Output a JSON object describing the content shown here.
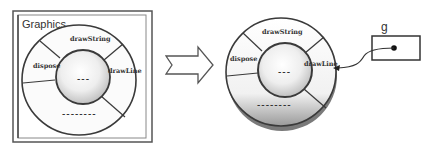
{
  "left_panel": {
    "title": "Graphics",
    "segments": {
      "top": "drawString",
      "left": "dispose",
      "right": "drawLine",
      "bottom": "--------"
    },
    "core_label": "---"
  },
  "transition_arrow": {
    "icon": "hollow-right-arrow-icon"
  },
  "right_object": {
    "segments": {
      "top": "drawString",
      "left": "dispose",
      "right": "drawLine",
      "bottom": "--------"
    },
    "core_label": "---"
  },
  "reference": {
    "variable_name": "g",
    "pointer_icon": "dot-icon",
    "target": "drawLine"
  },
  "colors": {
    "stroke": "#3a3a3a",
    "frame": "#555555",
    "ring_fill": "#f6f6f6",
    "core_light": "#fafafa",
    "core_dark": "#bdbdbd"
  }
}
